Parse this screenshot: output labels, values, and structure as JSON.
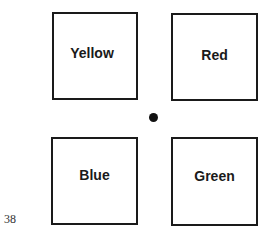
{
  "figure": {
    "boxes": [
      {
        "label": "Yellow",
        "position": "top-left"
      },
      {
        "label": "Red",
        "position": "top-right"
      },
      {
        "label": "Blue",
        "position": "bottom-left"
      },
      {
        "label": "Green",
        "position": "bottom-right"
      }
    ],
    "center_marker": "fixation-dot"
  },
  "page_number": "38"
}
